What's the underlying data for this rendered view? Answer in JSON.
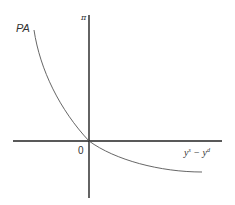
{
  "diagram": {
    "curve_label": "PA",
    "y_axis_label": "π",
    "origin_label": "0",
    "x_axis_label": {
      "base1": "y",
      "sup1": "s",
      "operator": " − ",
      "base2": "y",
      "sup2": "d"
    },
    "colors": {
      "axis": "#222222",
      "curve": "#555555",
      "text": "#333333"
    }
  }
}
